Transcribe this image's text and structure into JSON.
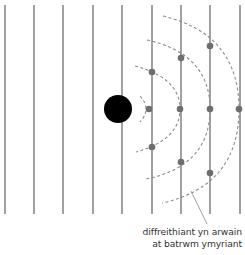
{
  "diagram": {
    "width": 245,
    "height": 255,
    "colors": {
      "background": "#ffffff",
      "wavefront_line": "#8a8a8a",
      "obstacle": "#000000",
      "dashed_arc": "#8c8c8c",
      "point": "#6e6e6e",
      "leader": "#8a8a8a",
      "text": "#333333"
    },
    "wavefronts_x": [
      5,
      34,
      63,
      93,
      122,
      152,
      181,
      210,
      240
    ],
    "wavefront_y_range": [
      5,
      214
    ],
    "obstacle": {
      "cx": 118,
      "cy": 109,
      "r": 14
    },
    "arcs": [
      {
        "name": "arc-1",
        "path": "M140 96 Q152 109 140 122"
      },
      {
        "name": "arc-2",
        "path": "M135 66 Q180 78 180 109 Q180 140 136 152"
      },
      {
        "name": "arc-3",
        "path": "M147 40 Q210 54 210 109 Q210 166 146 179"
      },
      {
        "name": "arc-4",
        "path": "M163 16 Q239 34 239 109 Q239 186 162 203"
      }
    ],
    "points": [
      {
        "x": 149,
        "y": 109
      },
      {
        "x": 180,
        "y": 109
      },
      {
        "x": 210,
        "y": 109
      },
      {
        "x": 239,
        "y": 109
      },
      {
        "x": 152,
        "y": 72
      },
      {
        "x": 181,
        "y": 58
      },
      {
        "x": 210,
        "y": 46
      },
      {
        "x": 152,
        "y": 147
      },
      {
        "x": 181,
        "y": 162
      },
      {
        "x": 210,
        "y": 173
      }
    ],
    "leader_line": {
      "x1": 191,
      "y1": 191,
      "x2": 207,
      "y2": 224
    },
    "label": {
      "line1": "diffreithiant yn arwain",
      "line2": "at batrwm ymyriant"
    }
  }
}
